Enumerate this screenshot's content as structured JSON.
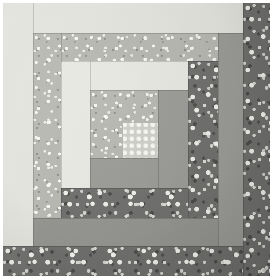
{
  "image": {
    "subject": "log-cabin quilt block",
    "width_px": 273,
    "height_px": 279,
    "paper_background": "#ffffff",
    "caption": ""
  },
  "palette": {
    "paper_white": "#ffffff",
    "cream_solid": "#e2e2dc",
    "white_solid": "#e7e7e2",
    "mid_gray_solid": "#9a9a97",
    "mid_gray_solid_alt": "#939390",
    "light_print_base": "#b6b6b1",
    "light_print_fleck": "#f3f3ef",
    "dark_print_base": "#6f6f6d",
    "dark_print_fleck": "#efefea",
    "dot_print_base": "#cfcfca",
    "dot_print_dot": "#f7f7f3"
  },
  "block": {
    "name": "log-cabin-block",
    "center": {
      "label": "center-patch",
      "fabric": "light-speckled-print",
      "x": 87,
      "y": 87,
      "w": 68,
      "h": 68
    },
    "center_dot": {
      "label": "center-dot-patch",
      "fabric": "white-dot-print",
      "x": 120,
      "y": 120,
      "w": 35,
      "h": 35
    },
    "logs": [
      {
        "id": "log-1-right-inner",
        "fabric": "mid-gray-solid",
        "side": "right",
        "ring": 1,
        "x": 155,
        "y": 87,
        "w": 30,
        "h": 98
      },
      {
        "id": "log-2-bottom-inner",
        "fabric": "mid-gray-solid",
        "side": "bottom",
        "ring": 1,
        "x": 87,
        "y": 155,
        "w": 68,
        "h": 30
      },
      {
        "id": "log-3-left-inner",
        "fabric": "white-solid",
        "side": "left",
        "ring": 2,
        "x": 58,
        "y": 58,
        "w": 29,
        "h": 127
      },
      {
        "id": "log-4-top-inner",
        "fabric": "white-solid",
        "side": "top",
        "ring": 2,
        "x": 87,
        "y": 58,
        "w": 98,
        "h": 29
      },
      {
        "id": "log-5-right-mid",
        "fabric": "dark-floral-print",
        "side": "right",
        "ring": 2,
        "x": 185,
        "y": 58,
        "w": 30,
        "h": 157
      },
      {
        "id": "log-6-bottom-mid",
        "fabric": "dark-floral-print",
        "side": "bottom",
        "ring": 2,
        "x": 58,
        "y": 185,
        "w": 127,
        "h": 30
      },
      {
        "id": "log-7-left-mid",
        "fabric": "light-speckled-print",
        "side": "left",
        "ring": 3,
        "x": 30,
        "y": 30,
        "w": 28,
        "h": 185
      },
      {
        "id": "log-8-top-mid",
        "fabric": "light-speckled-print",
        "side": "top",
        "ring": 3,
        "x": 58,
        "y": 30,
        "w": 157,
        "h": 28
      },
      {
        "id": "log-9-right-outer",
        "fabric": "mid-gray-solid",
        "side": "right",
        "ring": 3,
        "x": 215,
        "y": 30,
        "w": 25,
        "h": 213
      },
      {
        "id": "log-10-bottom-outer",
        "fabric": "mid-gray-solid",
        "side": "bottom",
        "ring": 3,
        "x": 30,
        "y": 215,
        "w": 185,
        "h": 28
      },
      {
        "id": "log-11-left-outer",
        "fabric": "cream-solid",
        "side": "left",
        "ring": 4,
        "x": 0,
        "y": 0,
        "w": 30,
        "h": 243
      },
      {
        "id": "log-12-top-outer",
        "fabric": "cream-solid",
        "side": "top",
        "ring": 4,
        "x": 30,
        "y": 0,
        "w": 210,
        "h": 30
      },
      {
        "id": "log-13-right-edge",
        "fabric": "dark-floral-print",
        "side": "right",
        "ring": 4,
        "x": 240,
        "y": 0,
        "w": 27,
        "h": 273
      },
      {
        "id": "log-14-bottom-edge",
        "fabric": "dark-floral-print",
        "side": "bottom",
        "ring": 4,
        "x": 0,
        "y": 243,
        "w": 240,
        "h": 30
      }
    ]
  },
  "fabrics": [
    {
      "key": "cream-solid",
      "label": "Cream solid",
      "class": "fab-cream"
    },
    {
      "key": "white-solid",
      "label": "Off-white solid",
      "class": "fab-white"
    },
    {
      "key": "mid-gray-solid",
      "label": "Medium gray solid",
      "class": "fab-midgray"
    },
    {
      "key": "light-speckled-print",
      "label": "Light speckled calico",
      "class": "fab-lightprint"
    },
    {
      "key": "dark-floral-print",
      "label": "Dark floral calico",
      "class": "fab-darkprint"
    },
    {
      "key": "white-dot-print",
      "label": "White dot print",
      "class": "fab-dotprint"
    }
  ]
}
